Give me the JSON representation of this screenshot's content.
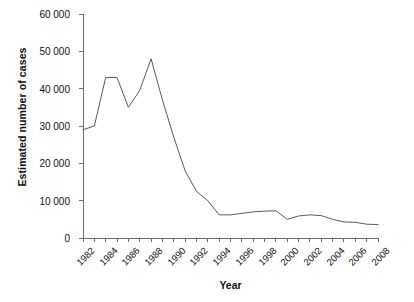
{
  "chart_data": {
    "type": "line",
    "title": "",
    "xlabel": "Year",
    "ylabel": "Estimated number of cases",
    "xlim": [
      1982,
      2008
    ],
    "ylim": [
      0,
      60000
    ],
    "grid": false,
    "legend": null,
    "y_ticks": [
      0,
      10000,
      20000,
      30000,
      40000,
      50000,
      60000
    ],
    "y_tick_labels": [
      "0",
      "10 000",
      "20 000",
      "30 000",
      "40 000",
      "50 000",
      "60 000"
    ],
    "x_ticks": [
      1982,
      1983,
      1984,
      1985,
      1986,
      1987,
      1988,
      1989,
      1990,
      1991,
      1992,
      1993,
      1994,
      1995,
      1996,
      1997,
      1998,
      1999,
      2000,
      2001,
      2002,
      2003,
      2004,
      2005,
      2006,
      2007,
      2008
    ],
    "x_tick_labels": [
      "1982",
      "1984",
      "1986",
      "1988",
      "1990",
      "1992",
      "1994",
      "1996",
      "1998",
      "2000",
      "2002",
      "2004",
      "2006",
      "2008"
    ],
    "x_tick_label_years": [
      1982,
      1984,
      1986,
      1988,
      1990,
      1992,
      1994,
      1996,
      1998,
      2000,
      2002,
      2004,
      2006,
      2008
    ],
    "x_tick_label_rotation": -45,
    "series": [
      {
        "name": "Estimated number of cases",
        "color": "#5a5a5a",
        "x": [
          1982,
          1983,
          1984,
          1985,
          1986,
          1987,
          1988,
          1989,
          1990,
          1991,
          1992,
          1993,
          1994,
          1995,
          1996,
          1997,
          1998,
          1999,
          2000,
          2001,
          2002,
          2003,
          2004,
          2005,
          2006,
          2007,
          2008
        ],
        "values": [
          29000,
          30000,
          43000,
          43000,
          35000,
          39500,
          48000,
          37000,
          27000,
          18000,
          12500,
          10000,
          6200,
          6200,
          6600,
          7000,
          7200,
          7300,
          5000,
          5900,
          6200,
          6000,
          5000,
          4300,
          4200,
          3700,
          3600
        ]
      }
    ]
  },
  "colors": {
    "axis": "#6e6e6e",
    "line": "#5a5a5a",
    "text": "#111111",
    "background": "#ffffff"
  }
}
